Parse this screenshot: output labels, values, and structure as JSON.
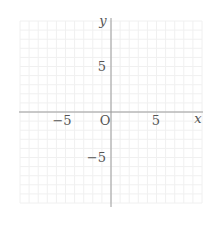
{
  "diagram": {
    "type": "coordinate-plane",
    "origin_label": "O",
    "x_axis_label": "x",
    "y_axis_label": "y",
    "x_range": [
      -10,
      10
    ],
    "y_range": [
      -10,
      10
    ],
    "grid_step": 1,
    "x_ticks": [
      {
        "value": -5,
        "label": "−5"
      },
      {
        "value": 5,
        "label": "5"
      }
    ],
    "y_ticks": [
      {
        "value": 5,
        "label": "5"
      },
      {
        "value": -5,
        "label": "−5"
      }
    ],
    "colors": {
      "grid": "#f0f0f0",
      "axis": "#9a9a9a",
      "label": "#555555"
    }
  }
}
